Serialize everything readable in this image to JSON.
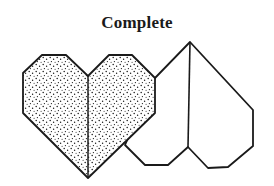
{
  "diagram": {
    "title": "Complete",
    "stroke_color": "#1a1a1a",
    "fill_pattern": "stipple-dots",
    "shapes": [
      {
        "name": "front-heart",
        "fill": "dotted",
        "outline": [
          [
            23,
            73
          ],
          [
            42,
            55
          ],
          [
            66,
            55
          ],
          [
            88,
            76
          ],
          [
            109,
            55
          ],
          [
            132,
            55
          ],
          [
            155,
            78
          ],
          [
            155,
            113
          ],
          [
            88,
            178
          ],
          [
            23,
            113
          ]
        ],
        "center_fold": [
          [
            88,
            76
          ],
          [
            88,
            178
          ]
        ]
      },
      {
        "name": "back-heart",
        "fill": "white",
        "outline": [
          [
            155,
            78
          ],
          [
            190,
            42
          ],
          [
            253,
            110
          ],
          [
            253,
            146
          ],
          [
            228,
            167
          ],
          [
            208,
            168
          ],
          [
            188,
            147
          ],
          [
            168,
            165
          ],
          [
            145,
            165
          ],
          [
            125,
            145
          ]
        ],
        "center_fold": [
          [
            190,
            42
          ],
          [
            188,
            147
          ]
        ]
      }
    ]
  }
}
